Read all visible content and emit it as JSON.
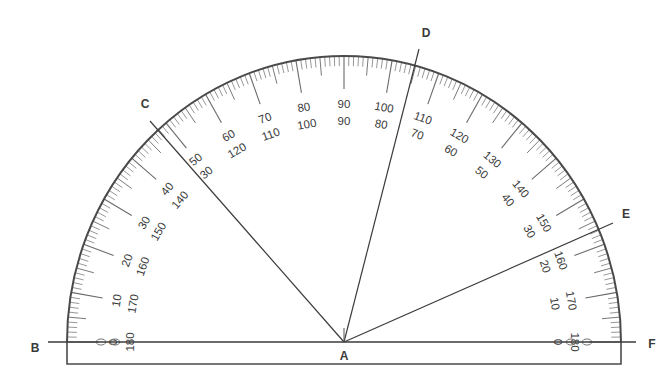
{
  "diagram": {
    "title": "Protractor measuring angles",
    "center_label": "A",
    "points": [
      {
        "id": "A",
        "label": "A",
        "x": 344,
        "y": 342,
        "label_x": 344,
        "label_y": 360
      },
      {
        "id": "B",
        "label": "B",
        "x": 48,
        "y": 342,
        "label_x": 35,
        "label_y": 352
      },
      {
        "id": "C",
        "label": "C",
        "x": 150,
        "y": 121,
        "label_x": 145,
        "label_y": 108
      },
      {
        "id": "D",
        "label": "D",
        "x": 419,
        "y": 49,
        "label_x": 426,
        "label_y": 37
      },
      {
        "id": "E",
        "label": "E",
        "x": 613,
        "y": 223,
        "label_x": 626,
        "label_y": 218
      },
      {
        "id": "F",
        "label": "F",
        "x": 636,
        "y": 342,
        "label_x": 652,
        "label_y": 348
      }
    ],
    "rays": [
      {
        "from": "A",
        "to": "B"
      },
      {
        "from": "A",
        "to": "C"
      },
      {
        "from": "A",
        "to": "D"
      },
      {
        "from": "A",
        "to": "E"
      },
      {
        "from": "A",
        "to": "F"
      }
    ],
    "protractor": {
      "center_x": 344,
      "center_y": 342,
      "radius_x": 277,
      "radius_y": 286,
      "base_bottom_y": 364,
      "outer_scale_labels": [
        0,
        10,
        20,
        30,
        40,
        50,
        60,
        70,
        80,
        90,
        100,
        110,
        120,
        130,
        140,
        150,
        160,
        170,
        180
      ],
      "inner_scale_labels": [
        180,
        170,
        160,
        150,
        140,
        130,
        120,
        110,
        100,
        90,
        80,
        70,
        60,
        50,
        40,
        30,
        20,
        10,
        0
      ],
      "visible_label_pairs": [
        {
          "angle_from_left": 0,
          "outer": "0",
          "inner": "180"
        },
        {
          "angle_from_left": 10,
          "outer": "10",
          "inner": "170"
        },
        {
          "angle_from_left": 20,
          "outer": "20",
          "inner": "160"
        },
        {
          "angle_from_left": 30,
          "outer": "30",
          "inner": "150"
        },
        {
          "angle_from_left": 40,
          "outer": "40",
          "inner": "140"
        },
        {
          "angle_from_left": 50,
          "outer": "50",
          "inner": "30"
        },
        {
          "angle_from_left": 60,
          "outer": "60",
          "inner": "120"
        },
        {
          "angle_from_left": 70,
          "outer": "70",
          "inner": "110"
        },
        {
          "angle_from_left": 80,
          "outer": "80",
          "inner": "100"
        },
        {
          "angle_from_left": 90,
          "outer": "90",
          "inner": "90"
        },
        {
          "angle_from_left": 100,
          "outer": "100",
          "inner": "80"
        },
        {
          "angle_from_left": 110,
          "outer": "110",
          "inner": "70"
        },
        {
          "angle_from_left": 120,
          "outer": "120",
          "inner": "60"
        },
        {
          "angle_from_left": 130,
          "outer": "130",
          "inner": "50"
        },
        {
          "angle_from_left": 140,
          "outer": "140",
          "inner": "40"
        },
        {
          "angle_from_left": 150,
          "outer": "150",
          "inner": "30"
        },
        {
          "angle_from_left": 160,
          "outer": "160",
          "inner": "20"
        },
        {
          "angle_from_left": 170,
          "outer": "170",
          "inner": "10"
        },
        {
          "angle_from_left": 180,
          "outer": "180",
          "inner": "0"
        }
      ]
    },
    "colors": {
      "line": "#3c3c3c",
      "tick": "#6a6a6a",
      "text": "#3a3a3a",
      "background": "#ffffff"
    }
  }
}
